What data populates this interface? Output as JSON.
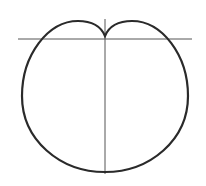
{
  "diagram": {
    "type": "cardioid",
    "colors": {
      "background": "#ffffff",
      "curve": "#2a2a2a",
      "axes": "#555555"
    },
    "axes": {
      "horizontal": {
        "x1": 18,
        "y1": 39,
        "x2": 192,
        "y2": 39
      },
      "vertical": {
        "x1": 105,
        "y1": 19,
        "x2": 105,
        "y2": 174
      }
    },
    "curve": {
      "cusp": [
        105,
        36
      ],
      "center_x": 105,
      "top_lobe_y": 22,
      "left_x": 22,
      "right_x": 188,
      "bottom_y": 172
    }
  }
}
